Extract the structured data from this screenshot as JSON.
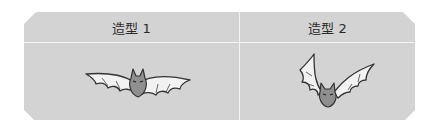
{
  "table": {
    "columns": [
      {
        "label": "造型 1",
        "image": "bat-wings-spread-icon"
      },
      {
        "label": "造型 2",
        "image": "bat-wings-raised-icon"
      }
    ]
  },
  "colors": {
    "panel": "#d3d3d3",
    "divider": "#f4f4f4",
    "bat_body": "#8f8f8f",
    "wing": "#f2f2f2",
    "outline": "#333333"
  }
}
